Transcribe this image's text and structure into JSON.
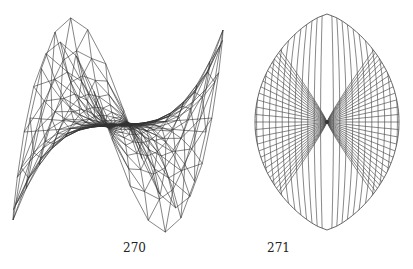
{
  "figures": [
    {
      "label": "270",
      "description": "3D wireframe mesh of a saddle-shaped surface (monkey saddle) with triangulated radial mesh",
      "stroke_color": "#333333"
    },
    {
      "label": "271",
      "description": "Lens-shaped planar grid with radial-circular mesh converging at center point",
      "stroke_color": "#555555"
    }
  ]
}
